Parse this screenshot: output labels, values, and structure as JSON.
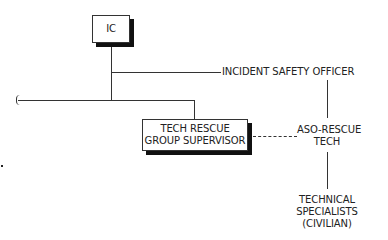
{
  "diagram": {
    "type": "org-chart",
    "nodes": {
      "ic": {
        "label": "IC"
      },
      "incident_safety_officer": {
        "label": "INCIDENT SAFETY OFFICER"
      },
      "tech_rescue_group_supervisor": {
        "lines": [
          "TECH RESCUE",
          "GROUP SUPERVISOR"
        ]
      },
      "aso_rescue_tech": {
        "lines": [
          "ASO-RESCUE",
          "TECH"
        ]
      },
      "technical_specialists": {
        "lines": [
          "TECHNICAL",
          "SPECIALISTS",
          "(CIVILIAN)"
        ]
      }
    },
    "edges": [
      {
        "from": "ic",
        "to": "incident_safety_officer",
        "style": "solid"
      },
      {
        "from": "ic",
        "to": "tech_rescue_group_supervisor",
        "style": "solid"
      },
      {
        "from": "tech_rescue_group_supervisor",
        "to": "aso_rescue_tech",
        "style": "dashed"
      },
      {
        "from": "incident_safety_officer",
        "to": "aso_rescue_tech",
        "style": "solid"
      },
      {
        "from": "aso_rescue_tech",
        "to": "technical_specialists",
        "style": "solid"
      }
    ]
  }
}
